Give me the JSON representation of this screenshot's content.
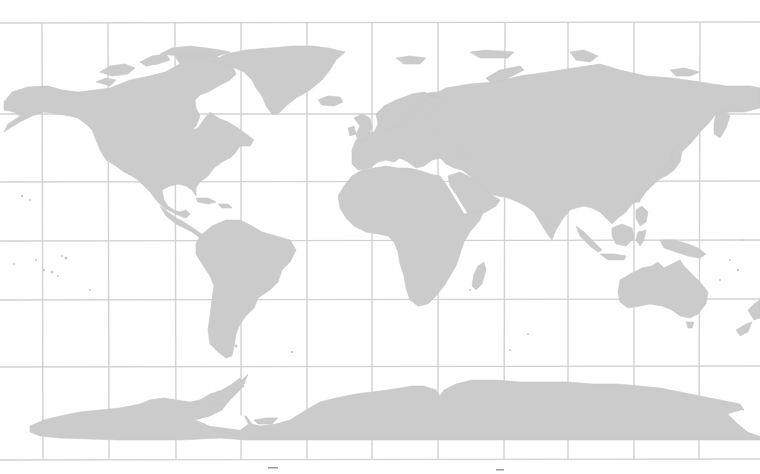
{
  "map": {
    "type": "world map",
    "projection": "equirectangular-like",
    "colors": {
      "background": "#ffffff",
      "land": "#cbcbcb",
      "grid": "#d2d2d2"
    },
    "grid": {
      "vertical_x": [
        42,
        108,
        175,
        241,
        307,
        372,
        438,
        505,
        568,
        634,
        700
      ],
      "horizontal_y": [
        23,
        114,
        182,
        241,
        300,
        367,
        460
      ]
    },
    "regions": [
      "North America",
      "Greenland",
      "South America",
      "Europe",
      "Africa",
      "Asia",
      "Australia",
      "New Zealand",
      "Antarctica",
      "Madagascar",
      "Japan",
      "Indonesia"
    ]
  }
}
